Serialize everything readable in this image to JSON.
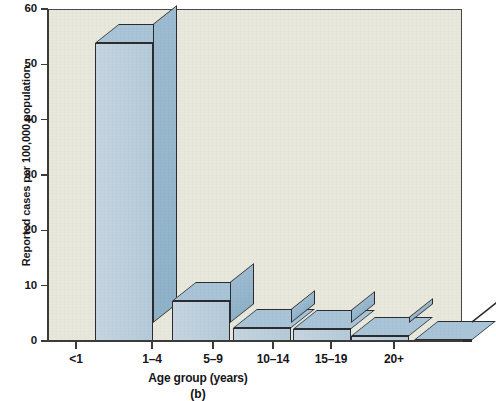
{
  "chart_data": {
    "type": "bar",
    "title": "",
    "subtitle": "",
    "caption": "(b)",
    "xlabel": "Age group (years)",
    "ylabel": "Reported cases per 100,000 population",
    "categories": [
      "<1",
      "1–4",
      "5–9",
      "10–14",
      "15–19",
      "20+"
    ],
    "values": [
      54,
      7.4,
      2.5,
      2.4,
      1.1,
      0.3
    ],
    "ylim": [
      0,
      60
    ],
    "ytick_values": [
      0,
      10,
      20,
      30,
      40,
      50,
      60
    ],
    "ytick_labels": [
      "0",
      "10",
      "20",
      "30",
      "40",
      "50",
      "60"
    ],
    "grid": false,
    "legend": null,
    "style": "3d-isometric-bars",
    "colors": {
      "bar_front": "#bdd0dd",
      "bar_top": "#a8c4d6",
      "bar_side": "#8fb2c9",
      "bar_outline": "#2c2c30",
      "plot_background": "#e9e8dd",
      "axis": "#3b3b38",
      "text": "#16161a",
      "page_background": "#ffffff"
    }
  }
}
